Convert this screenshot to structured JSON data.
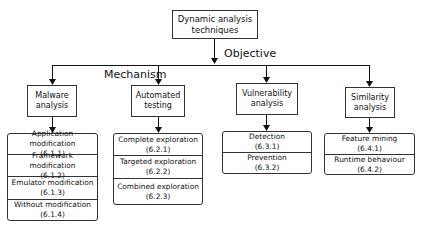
{
  "root": {
    "line1": "Dynamic analysis",
    "line2": "techniques"
  },
  "labels": {
    "objective": "Objective",
    "mechanism": "Mechanism"
  },
  "categories": [
    {
      "title1": "Malware",
      "title2": "analysis",
      "items": [
        {
          "name": "Application modification",
          "section": "(6.1.1)"
        },
        {
          "name": "Framework modification",
          "section": "(6.1.2)"
        },
        {
          "name": "Emulator modification",
          "section": "(6.1.3)"
        },
        {
          "name": "Without modification",
          "section": "(6.1.4)"
        }
      ]
    },
    {
      "title1": "Automated",
      "title2": "testing",
      "items": [
        {
          "name": "Complete exploration",
          "section": "(6.2.1)"
        },
        {
          "name": "Targeted exploration",
          "section": "(6.2.2)"
        },
        {
          "name": "Combined exploration",
          "section": "(6.2.3)"
        }
      ]
    },
    {
      "title1": "Vulnerability",
      "title2": "analysis",
      "items": [
        {
          "name": "Detection",
          "section": "(6.3.1)"
        },
        {
          "name": "Prevention",
          "section": "(6.3.2)"
        }
      ]
    },
    {
      "title1": "Similarity",
      "title2": "analysis",
      "items": [
        {
          "name": "Feature mining",
          "section": "(6.4.1)"
        },
        {
          "name": "Runtime behaviour",
          "section": "(6.4.2)"
        }
      ]
    }
  ]
}
